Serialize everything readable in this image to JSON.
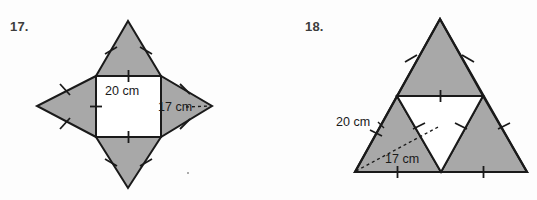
{
  "page": {
    "background_color": "#fdfdfd",
    "shade_color": "#a8a8a8",
    "stroke_color": "#1a1a1a",
    "white_fill": "#ffffff",
    "number_color": "#3c3c3c"
  },
  "problems": [
    {
      "number": "17.",
      "figure_name": "four-pointed-star-square-with-triangles",
      "labels": {
        "square_side": "20 cm",
        "triangle_slant": "17 cm"
      },
      "geometry": {
        "square": {
          "left": 96,
          "top": 76,
          "right": 161,
          "bottom": 137
        },
        "apex_top": [
          128,
          21
        ],
        "apex_bottom": [
          128,
          188
        ],
        "apex_left": [
          37,
          106
        ],
        "apex_right": [
          212,
          106
        ]
      }
    },
    {
      "number": "18.",
      "figure_name": "subdivided-equilateral-triangle",
      "labels": {
        "outer_side": "20 cm",
        "inner_segment": "17 cm"
      },
      "geometry": {
        "apex": [
          440,
          19
        ],
        "base_left": [
          355,
          172
        ],
        "base_right": [
          527,
          172
        ],
        "mid_left": [
          397,
          96
        ],
        "mid_right": [
          483,
          96
        ],
        "mid_base": [
          441,
          172
        ]
      }
    }
  ]
}
